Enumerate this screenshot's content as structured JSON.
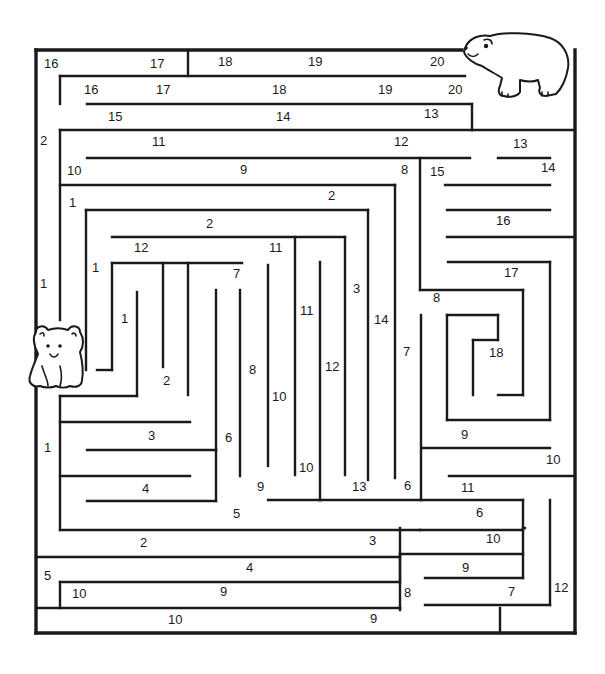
{
  "puzzle": {
    "type": "number-path maze",
    "start_character": "bear-cub",
    "goal_character": "polar-bear",
    "colors": {
      "ink": "#1a1a1a",
      "paper": "#ffffff"
    }
  },
  "outer_walls": [
    [
      36,
      50,
      36,
      633
    ],
    [
      36,
      633,
      575,
      633
    ],
    [
      575,
      633,
      575,
      50
    ],
    [
      36,
      50,
      462,
      50
    ]
  ],
  "walls": [
    [
      188,
      50,
      188,
      76
    ],
    [
      60,
      76,
      465,
      76
    ],
    [
      60,
      76,
      60,
      104
    ],
    [
      87,
      104,
      472,
      104
    ],
    [
      60,
      130,
      472,
      130
    ],
    [
      472,
      104,
      472,
      130
    ],
    [
      472,
      130,
      575,
      130
    ],
    [
      60,
      130,
      60,
      320
    ],
    [
      87,
      158,
      470,
      158
    ],
    [
      498,
      158,
      550,
      158
    ],
    [
      60,
      185,
      395,
      185
    ],
    [
      395,
      185,
      395,
      478
    ],
    [
      420,
      158,
      420,
      290
    ],
    [
      420,
      290,
      523,
      290
    ],
    [
      523,
      290,
      523,
      395
    ],
    [
      523,
      395,
      498,
      395
    ],
    [
      445,
      185,
      550,
      185
    ],
    [
      447,
      210,
      550,
      210
    ],
    [
      447,
      237,
      575,
      237
    ],
    [
      448,
      262,
      550,
      262
    ],
    [
      550,
      262,
      550,
      420
    ],
    [
      550,
      420,
      447,
      420
    ],
    [
      447,
      420,
      447,
      315
    ],
    [
      447,
      315,
      498,
      315
    ],
    [
      498,
      315,
      498,
      340
    ],
    [
      498,
      340,
      473,
      340
    ],
    [
      473,
      340,
      473,
      395
    ],
    [
      86,
      210,
      368,
      210
    ],
    [
      86,
      210,
      86,
      370
    ],
    [
      368,
      210,
      368,
      480
    ],
    [
      112,
      237,
      345,
      237
    ],
    [
      345,
      237,
      345,
      475
    ],
    [
      295,
      237,
      295,
      475
    ],
    [
      112,
      263,
      242,
      263
    ],
    [
      112,
      263,
      112,
      370
    ],
    [
      112,
      370,
      97,
      370
    ],
    [
      163,
      263,
      163,
      367
    ],
    [
      188,
      263,
      188,
      395
    ],
    [
      137,
      292,
      137,
      396
    ],
    [
      137,
      396,
      60,
      396
    ],
    [
      60,
      396,
      60,
      530
    ],
    [
      60,
      530,
      420,
      530
    ],
    [
      60,
      422,
      190,
      422
    ],
    [
      87,
      450,
      216,
      450
    ],
    [
      216,
      450,
      216,
      290
    ],
    [
      60,
      476,
      190,
      476
    ],
    [
      87,
      501,
      216,
      501
    ],
    [
      216,
      501,
      216,
      450
    ],
    [
      240,
      290,
      240,
      476
    ],
    [
      268,
      265,
      268,
      466
    ],
    [
      320,
      262,
      320,
      500
    ],
    [
      320,
      500,
      420,
      500
    ],
    [
      268,
      500,
      320,
      500
    ],
    [
      421,
      315,
      421,
      500
    ],
    [
      421,
      500,
      523,
      500
    ],
    [
      523,
      500,
      523,
      528
    ],
    [
      422,
      448,
      550,
      448
    ],
    [
      449,
      476,
      575,
      476
    ],
    [
      420,
      530,
      523,
      530
    ],
    [
      523,
      528,
      525,
      528
    ],
    [
      550,
      500,
      550,
      605
    ],
    [
      550,
      605,
      425,
      605
    ],
    [
      400,
      528,
      400,
      582
    ],
    [
      36,
      557,
      400,
      557
    ],
    [
      400,
      554,
      523,
      554
    ],
    [
      523,
      530,
      523,
      578
    ],
    [
      523,
      578,
      425,
      578
    ],
    [
      400,
      582,
      60,
      582
    ],
    [
      60,
      582,
      60,
      608
    ],
    [
      36,
      608,
      400,
      608
    ],
    [
      400,
      608,
      400,
      608
    ],
    [
      500,
      608,
      500,
      633
    ],
    [
      400,
      554,
      400,
      610
    ]
  ],
  "labels": [
    {
      "t": "16",
      "x": 44,
      "y": 68
    },
    {
      "t": "17",
      "x": 150,
      "y": 68
    },
    {
      "t": "18",
      "x": 218,
      "y": 66
    },
    {
      "t": "19",
      "x": 308,
      "y": 66
    },
    {
      "t": "20",
      "x": 430,
      "y": 66
    },
    {
      "t": "16",
      "x": 84,
      "y": 94
    },
    {
      "t": "17",
      "x": 156,
      "y": 94
    },
    {
      "t": "18",
      "x": 272,
      "y": 94
    },
    {
      "t": "19",
      "x": 378,
      "y": 94
    },
    {
      "t": "20",
      "x": 448,
      "y": 94
    },
    {
      "t": "15",
      "x": 108,
      "y": 121
    },
    {
      "t": "14",
      "x": 276,
      "y": 121
    },
    {
      "t": "13",
      "x": 424,
      "y": 118
    },
    {
      "t": "2",
      "x": 40,
      "y": 145
    },
    {
      "t": "11",
      "x": 152,
      "y": 146
    },
    {
      "t": "12",
      "x": 394,
      "y": 146
    },
    {
      "t": "13",
      "x": 513,
      "y": 148
    },
    {
      "t": "10",
      "x": 67,
      "y": 175
    },
    {
      "t": "9",
      "x": 240,
      "y": 174
    },
    {
      "t": "8",
      "x": 401,
      "y": 174
    },
    {
      "t": "15",
      "x": 430,
      "y": 176
    },
    {
      "t": "14",
      "x": 541,
      "y": 172
    },
    {
      "t": "1",
      "x": 69,
      "y": 207
    },
    {
      "t": "2",
      "x": 328,
      "y": 200
    },
    {
      "t": "2",
      "x": 206,
      "y": 228
    },
    {
      "t": "16",
      "x": 496,
      "y": 225
    },
    {
      "t": "12",
      "x": 134,
      "y": 252
    },
    {
      "t": "11",
      "x": 269,
      "y": 252
    },
    {
      "t": "1",
      "x": 92,
      "y": 272
    },
    {
      "t": "7",
      "x": 233,
      "y": 278
    },
    {
      "t": "17",
      "x": 504,
      "y": 277
    },
    {
      "t": "1",
      "x": 40,
      "y": 288
    },
    {
      "t": "3",
      "x": 353,
      "y": 293
    },
    {
      "t": "8",
      "x": 433,
      "y": 302
    },
    {
      "t": "1",
      "x": 121,
      "y": 323
    },
    {
      "t": "11",
      "x": 300,
      "y": 315
    },
    {
      "t": "14",
      "x": 374,
      "y": 324
    },
    {
      "t": "7",
      "x": 403,
      "y": 356
    },
    {
      "t": "18",
      "x": 489,
      "y": 357
    },
    {
      "t": "8",
      "x": 249,
      "y": 374
    },
    {
      "t": "12",
      "x": 325,
      "y": 371
    },
    {
      "t": "2",
      "x": 163,
      "y": 385
    },
    {
      "t": "10",
      "x": 272,
      "y": 401
    },
    {
      "t": "3",
      "x": 148,
      "y": 440
    },
    {
      "t": "6",
      "x": 225,
      "y": 442
    },
    {
      "t": "9",
      "x": 461,
      "y": 439
    },
    {
      "t": "1",
      "x": 44,
      "y": 452
    },
    {
      "t": "10",
      "x": 546,
      "y": 464
    },
    {
      "t": "10",
      "x": 299,
      "y": 472
    },
    {
      "t": "4",
      "x": 142,
      "y": 493
    },
    {
      "t": "9",
      "x": 257,
      "y": 491
    },
    {
      "t": "13",
      "x": 352,
      "y": 491
    },
    {
      "t": "6",
      "x": 404,
      "y": 490
    },
    {
      "t": "11",
      "x": 461,
      "y": 492
    },
    {
      "t": "5",
      "x": 233,
      "y": 518
    },
    {
      "t": "6",
      "x": 476,
      "y": 517
    },
    {
      "t": "2",
      "x": 140,
      "y": 547
    },
    {
      "t": "3",
      "x": 369,
      "y": 545
    },
    {
      "t": "10",
      "x": 486,
      "y": 543
    },
    {
      "t": "4",
      "x": 246,
      "y": 572
    },
    {
      "t": "9",
      "x": 462,
      "y": 572
    },
    {
      "t": "5",
      "x": 44,
      "y": 580
    },
    {
      "t": "12",
      "x": 554,
      "y": 592
    },
    {
      "t": "10",
      "x": 72,
      "y": 598
    },
    {
      "t": "9",
      "x": 220,
      "y": 596
    },
    {
      "t": "8",
      "x": 404,
      "y": 597
    },
    {
      "t": "7",
      "x": 508,
      "y": 596
    },
    {
      "t": "10",
      "x": 168,
      "y": 624
    },
    {
      "t": "9",
      "x": 370,
      "y": 623
    }
  ]
}
